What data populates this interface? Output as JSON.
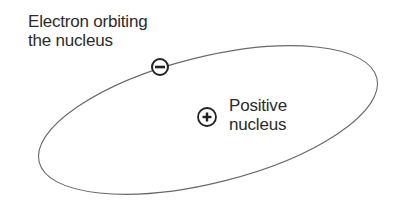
{
  "diagram": {
    "labels": {
      "electron_line1": "Electron orbiting",
      "electron_line2": "the nucleus",
      "nucleus_line1": "Positive",
      "nucleus_line2": "nucleus"
    },
    "symbols": {
      "electron": "−",
      "nucleus": "+"
    },
    "colors": {
      "stroke": "#555555",
      "text": "#2b2b2b",
      "background": "#ffffff"
    }
  }
}
